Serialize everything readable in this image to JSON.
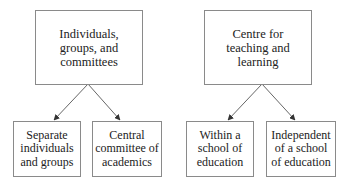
{
  "diagram": {
    "type": "tree",
    "groups": [
      {
        "parent": {
          "label": "Individuals,\ngroups, and\ncommittees"
        },
        "children": [
          {
            "label": "Separate\nindividuals\nand groups"
          },
          {
            "label": "Central\ncommittee of\nacademics"
          }
        ]
      },
      {
        "parent": {
          "label": "Centre for\nteaching and\nlearning"
        },
        "children": [
          {
            "label": "Within a\nschool of\neducation"
          },
          {
            "label": "Independent\nof a school\nof education"
          }
        ]
      }
    ],
    "colors": {
      "border": "#8a8a8a",
      "arrow": "#555555",
      "text": "#222222",
      "background": "#ffffff"
    }
  }
}
